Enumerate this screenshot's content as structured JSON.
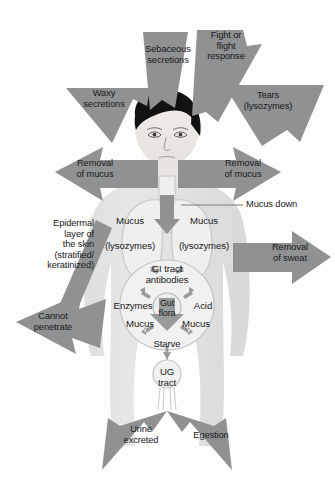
{
  "figure": {
    "background_color": "#fdfdfd",
    "arrow_color": "#8f9193",
    "body_color": "#e2e2e2",
    "organ_outline_color": "#bdbdbd",
    "hair_color": "#111111",
    "text_color": "#1a1a1a"
  },
  "arrows": [
    {
      "id": "sebaceous",
      "label": "Sebaceous\nsecretions",
      "direction": "up"
    },
    {
      "id": "fight-flight",
      "label": "Fight or\nflight\nresponse",
      "direction": "up-right"
    },
    {
      "id": "waxy",
      "label": "Waxy\nsecretions",
      "direction": "up-left"
    },
    {
      "id": "tears",
      "label": "Tears\n(lysozymes)",
      "direction": "up-right"
    },
    {
      "id": "removal-mucus-left",
      "label": "Removal\nof mucus",
      "direction": "left"
    },
    {
      "id": "removal-mucus-right",
      "label": "Removal\nof mucus",
      "direction": "right"
    },
    {
      "id": "removal-sweat",
      "label": "Removal\nof sweat",
      "direction": "right"
    },
    {
      "id": "cannot-penetrate",
      "label": "Cannot\npenetrate",
      "direction": "down-left"
    },
    {
      "id": "urine-excreted",
      "label": "Urine\nexcreted",
      "direction": "down-left"
    },
    {
      "id": "egestion",
      "label": "Egestion",
      "direction": "down-right"
    }
  ],
  "callouts": [
    {
      "id": "mucus-down",
      "label": "Mucus down",
      "leader_line": true
    },
    {
      "id": "epidermal",
      "label": "Epidermal\nlayer of\nthe skin\n(stratified/\nkeratinized)",
      "leader_line": false
    }
  ],
  "organ_labels": [
    {
      "id": "mucus-left",
      "label": "Mucus"
    },
    {
      "id": "mucus-right",
      "label": "Mucus"
    },
    {
      "id": "lysozymes-left",
      "label": "(lysozymes)"
    },
    {
      "id": "lysozymes-right",
      "label": "(lysozymes)"
    },
    {
      "id": "gi-tract",
      "label": "GI tract\nantibodies"
    },
    {
      "id": "enzymes",
      "label": "Enzymes"
    },
    {
      "id": "acid",
      "label": "Acid"
    },
    {
      "id": "gut-flora",
      "label": "Gut\nflora"
    },
    {
      "id": "mucus-gut-left",
      "label": "Mucus"
    },
    {
      "id": "mucus-gut-right",
      "label": "Mucus"
    },
    {
      "id": "starve",
      "label": "Starve"
    },
    {
      "id": "ug-tract",
      "label": "UG\ntract"
    }
  ]
}
